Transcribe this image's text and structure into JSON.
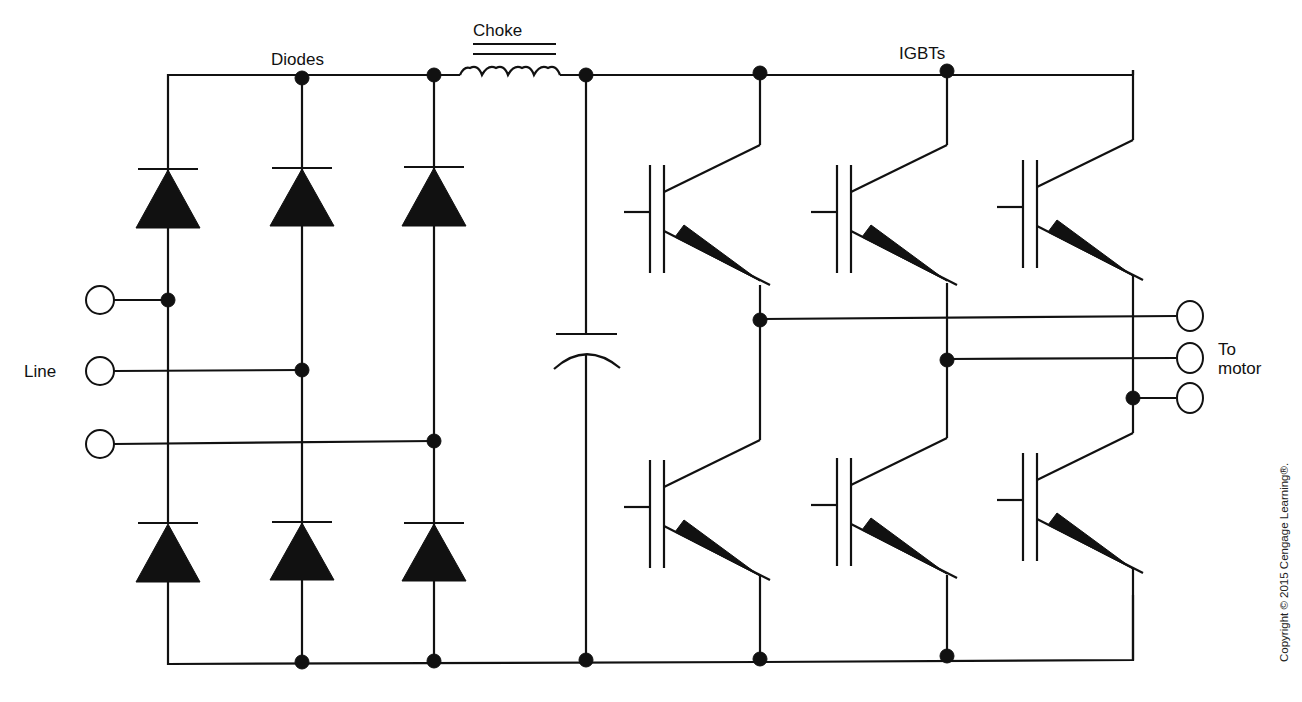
{
  "diagram": {
    "type": "three-phase variable frequency drive (VFD) power circuit schematic",
    "labels": {
      "diodes": "Diodes",
      "choke": "Choke",
      "igbts": "IGBTs",
      "line": "Line",
      "to_motor_line1": "To",
      "to_motor_line2": "motor"
    },
    "copyright": "Copyright © 2015 Cengage Learning®.",
    "sections": [
      {
        "name": "rectifier",
        "component": "diode",
        "count": 6,
        "arrangement": "3-phase full bridge"
      },
      {
        "name": "dc-bus",
        "components": [
          "choke (inductor)",
          "capacitor"
        ]
      },
      {
        "name": "inverter",
        "component": "IGBT",
        "count": 6,
        "arrangement": "3-phase bridge"
      }
    ],
    "input_terminals": 3,
    "output_terminals": 3,
    "colors": {
      "line": "#111111",
      "background": "#ffffff"
    }
  }
}
